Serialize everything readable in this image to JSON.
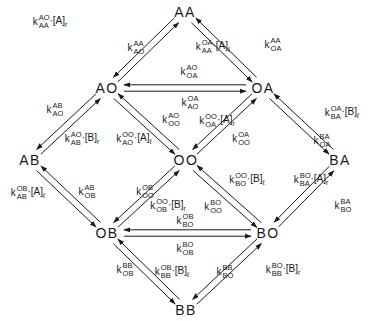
{
  "diagram": {
    "type": "kinetic-state-scheme",
    "nodes": [
      {
        "id": "AA",
        "label": "AA",
        "x": 185,
        "y": 12
      },
      {
        "id": "AO",
        "label": "AO",
        "x": 107,
        "y": 88
      },
      {
        "id": "OA",
        "label": "OA",
        "x": 263,
        "y": 88
      },
      {
        "id": "AB",
        "label": "AB",
        "x": 30,
        "y": 160
      },
      {
        "id": "OO",
        "label": "OO",
        "x": 186,
        "y": 160
      },
      {
        "id": "BA",
        "label": "BA",
        "x": 340,
        "y": 160
      },
      {
        "id": "OB",
        "label": "OB",
        "x": 107,
        "y": 233
      },
      {
        "id": "BO",
        "label": "BO",
        "x": 268,
        "y": 233
      },
      {
        "id": "BB",
        "label": "BB",
        "x": 186,
        "y": 310
      }
    ],
    "labels": [
      {
        "id": "k_AA_AO",
        "k": "k",
        "sup": "AO",
        "sub": "AA",
        "conc": "·[A]",
        "conc_sub": "r",
        "x": 50,
        "y": 22
      },
      {
        "id": "k_AO_AA",
        "k": "k",
        "sup": "AA",
        "sub": "AO",
        "conc": "",
        "conc_sub": "",
        "x": 136,
        "y": 48
      },
      {
        "id": "k_AA_OA",
        "k": "k",
        "sup": "OA",
        "sub": "AA",
        "conc": "·[A]",
        "conc_sub": "ℓ",
        "x": 213,
        "y": 47
      },
      {
        "id": "k_OA_AA",
        "k": "k",
        "sup": "AA",
        "sub": "OA",
        "conc": "",
        "conc_sub": "",
        "x": 273,
        "y": 45
      },
      {
        "id": "k_OA_AO",
        "k": "k",
        "sup": "AO",
        "sub": "OA",
        "conc": "",
        "conc_sub": "",
        "x": 189,
        "y": 72
      },
      {
        "id": "k_AO_OA",
        "k": "k",
        "sup": "OA",
        "sub": "AO",
        "conc": "",
        "conc_sub": "",
        "x": 190,
        "y": 103
      },
      {
        "id": "k_AO_AB",
        "k": "k",
        "sup": "AB",
        "sub": "AO",
        "conc": "",
        "conc_sub": "",
        "x": 55,
        "y": 110
      },
      {
        "id": "k_AB_AO",
        "k": "k",
        "sup": "AO",
        "sub": "AB",
        "conc": "·[B]",
        "conc_sub": "r",
        "x": 82,
        "y": 139
      },
      {
        "id": "k_AO_OO",
        "k": "k",
        "sup": "OO",
        "sub": "AO",
        "conc": "·[A]",
        "conc_sub": "ℓ",
        "x": 134,
        "y": 139
      },
      {
        "id": "k_OO_AO",
        "k": "k",
        "sup": "AO",
        "sub": "OO",
        "conc": "",
        "conc_sub": "",
        "x": 171,
        "y": 120
      },
      {
        "id": "k_OA_OO",
        "k": "k",
        "sup": "OO",
        "sub": "OA",
        "conc": "·[A]",
        "conc_sub": "r",
        "x": 217,
        "y": 121
      },
      {
        "id": "k_OO_OA",
        "k": "k",
        "sup": "OA",
        "sub": "OO",
        "conc": "",
        "conc_sub": "",
        "x": 241,
        "y": 139
      },
      {
        "id": "k_BA_OA",
        "k": "k",
        "sup": "OA",
        "sub": "BA",
        "conc": "·[B]",
        "conc_sub": "ℓ",
        "x": 342,
        "y": 113
      },
      {
        "id": "k_OA_BA",
        "k": "k",
        "sup": "BA",
        "sub": "OA",
        "conc": "",
        "conc_sub": "",
        "x": 322,
        "y": 141
      },
      {
        "id": "k_AB_OB",
        "k": "k",
        "sup": "OB",
        "sub": "AB",
        "conc": "·[A]",
        "conc_sub": "ℓ",
        "x": 28,
        "y": 193
      },
      {
        "id": "k_OB_AB",
        "k": "k",
        "sup": "AB",
        "sub": "OB",
        "conc": "",
        "conc_sub": "",
        "x": 87,
        "y": 192
      },
      {
        "id": "k_OO_OB",
        "k": "k",
        "sup": "OB",
        "sub": "OO",
        "conc": "",
        "conc_sub": "",
        "x": 145,
        "y": 192
      },
      {
        "id": "k_OB_OO",
        "k": "k",
        "sup": "OO",
        "sub": "OB",
        "conc": "·[B]",
        "conc_sub": "r",
        "x": 168,
        "y": 206
      },
      {
        "id": "k_OO_BO",
        "k": "k",
        "sup": "BO",
        "sub": "OO",
        "conc": "",
        "conc_sub": "",
        "x": 213,
        "y": 207
      },
      {
        "id": "k_BO_OO",
        "k": "k",
        "sup": "OO",
        "sub": "BO",
        "conc": "·[B]",
        "conc_sub": "ℓ",
        "x": 247,
        "y": 180
      },
      {
        "id": "k_BA_BO",
        "k": "k",
        "sup": "BO",
        "sub": "BA",
        "conc": "·[A]",
        "conc_sub": "r",
        "x": 311,
        "y": 180
      },
      {
        "id": "k_BO_BA",
        "k": "k",
        "sup": "BA",
        "sub": "BO",
        "conc": "",
        "conc_sub": "",
        "x": 343,
        "y": 206
      },
      {
        "id": "k_BO_OB",
        "k": "k",
        "sup": "OB",
        "sub": "BO",
        "conc": "",
        "conc_sub": "",
        "x": 185,
        "y": 221
      },
      {
        "id": "k_OB_BO",
        "k": "k",
        "sup": "BO",
        "sub": "OB",
        "conc": "",
        "conc_sub": "",
        "x": 185,
        "y": 249
      },
      {
        "id": "k_OB_BB",
        "k": "k",
        "sup": "BB",
        "sub": "OB",
        "conc": "",
        "conc_sub": "",
        "x": 125,
        "y": 270
      },
      {
        "id": "k_BB_OB",
        "k": "k",
        "sup": "OB",
        "sub": "BB",
        "conc": "·[B]",
        "conc_sub": "ℓ",
        "x": 172,
        "y": 272
      },
      {
        "id": "k_BO_BB",
        "k": "k",
        "sup": "BB",
        "sub": "BO",
        "conc": "",
        "conc_sub": "",
        "x": 225,
        "y": 272
      },
      {
        "id": "k_BB_BO",
        "k": "k",
        "sup": "BO",
        "sub": "BB",
        "conc": "·[B]",
        "conc_sub": "r",
        "x": 283,
        "y": 270
      }
    ],
    "edges": [
      {
        "from": "AO",
        "to": "AA"
      },
      {
        "from": "AA",
        "to": "AO"
      },
      {
        "from": "AA",
        "to": "OA"
      },
      {
        "from": "OA",
        "to": "AA"
      },
      {
        "from": "AO",
        "to": "OA"
      },
      {
        "from": "OA",
        "to": "AO"
      },
      {
        "from": "AB",
        "to": "AO"
      },
      {
        "from": "AO",
        "to": "AB"
      },
      {
        "from": "AO",
        "to": "OO"
      },
      {
        "from": "OO",
        "to": "AO"
      },
      {
        "from": "OO",
        "to": "OA"
      },
      {
        "from": "OA",
        "to": "OO"
      },
      {
        "from": "OA",
        "to": "BA"
      },
      {
        "from": "BA",
        "to": "OA"
      },
      {
        "from": "AB",
        "to": "OB"
      },
      {
        "from": "OB",
        "to": "AB"
      },
      {
        "from": "OB",
        "to": "OO"
      },
      {
        "from": "OO",
        "to": "OB"
      },
      {
        "from": "OO",
        "to": "BO"
      },
      {
        "from": "BO",
        "to": "OO"
      },
      {
        "from": "BO",
        "to": "BA"
      },
      {
        "from": "BA",
        "to": "BO"
      },
      {
        "from": "OB",
        "to": "BO"
      },
      {
        "from": "BO",
        "to": "OB"
      },
      {
        "from": "BB",
        "to": "OB"
      },
      {
        "from": "OB",
        "to": "BB"
      },
      {
        "from": "BB",
        "to": "BO"
      },
      {
        "from": "BO",
        "to": "BB"
      }
    ],
    "line_color": "#1a1a1a"
  }
}
